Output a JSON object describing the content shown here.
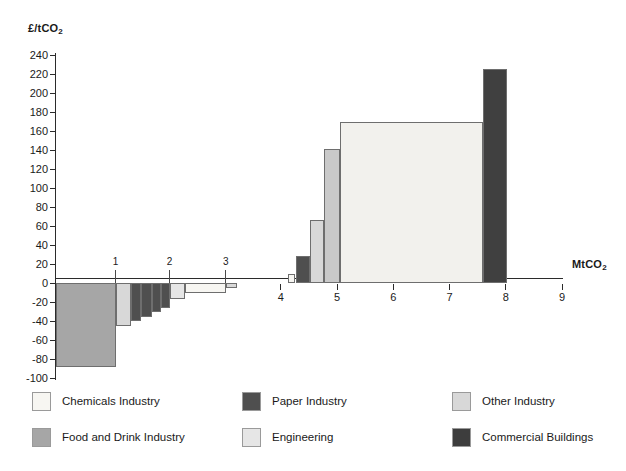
{
  "chart_data": {
    "type": "bar",
    "title": "",
    "subtitle": "",
    "ylabel": "£/tCO2",
    "ylabel_html": "£/tCO₂",
    "xlabel": "MtCO2",
    "xlabel_html": "MtCO₂",
    "ylim": [
      -100,
      240
    ],
    "xlim": [
      0,
      9
    ],
    "y_ticks": [
      240,
      220,
      200,
      180,
      160,
      140,
      120,
      100,
      80,
      60,
      40,
      20,
      0,
      -20,
      -40,
      -60,
      -80,
      -100
    ],
    "x_ticks": [
      0,
      1,
      2,
      3,
      4,
      5,
      6,
      7,
      8,
      9
    ],
    "x_ticks_visible": [
      4,
      5,
      6,
      7,
      8,
      9
    ],
    "grid": false,
    "legend_position": "bottom",
    "orientation": "marginal-abatement-cost-curve",
    "note": "Width of each bar = abatement potential in MtCO2; height = cost in GBP per tCO2",
    "series": [
      {
        "name": "Chemicals Industry",
        "color": "#f7f6f2"
      },
      {
        "name": "Paper Industry",
        "color": "#4f4f4f"
      },
      {
        "name": "Other Industry",
        "color": "#d8d8d8"
      },
      {
        "name": "Food and Drink Industry",
        "color": "#a6a6a6"
      },
      {
        "name": "Engineering",
        "color": "#e6e6e6"
      },
      {
        "name": "Commercial Buildings",
        "color": "#404040"
      }
    ],
    "bars": [
      {
        "category": "Food and Drink Industry",
        "x_start": 0.0,
        "x_end": 1.06,
        "value": -88,
        "color": "#a6a6a6"
      },
      {
        "category": "Other Industry",
        "x_start": 1.06,
        "x_end": 1.33,
        "value": -45,
        "color": "#d8d8d8"
      },
      {
        "category": "Paper Industry",
        "x_start": 1.33,
        "x_end": 1.52,
        "value": -40,
        "color": "#4f4f4f"
      },
      {
        "category": "Paper Industry",
        "x_start": 1.52,
        "x_end": 1.7,
        "value": -36,
        "color": "#4f4f4f"
      },
      {
        "category": "Paper Industry",
        "x_start": 1.7,
        "x_end": 1.86,
        "value": -31,
        "color": "#4f4f4f"
      },
      {
        "category": "Paper Industry",
        "x_start": 1.86,
        "x_end": 2.02,
        "value": -26,
        "color": "#4f4f4f"
      },
      {
        "category": "Engineering",
        "x_start": 2.02,
        "x_end": 2.3,
        "value": -17,
        "color": "#e6e6e6"
      },
      {
        "category": "Chemicals Industry",
        "x_start": 2.3,
        "x_end": 3.02,
        "value": -11,
        "color": "#f7f6f2"
      },
      {
        "category": "Other Industry",
        "x_start": 3.02,
        "x_end": 3.22,
        "value": -5,
        "color": "#d8d8d8"
      },
      {
        "category": "Chemicals Industry",
        "x_start": 4.12,
        "x_end": 4.26,
        "value": 10,
        "color": "#f7f6f2"
      },
      {
        "category": "Paper Industry",
        "x_start": 4.26,
        "x_end": 4.52,
        "value": 28,
        "color": "#4f4f4f"
      },
      {
        "category": "Other Industry",
        "x_start": 4.52,
        "x_end": 4.76,
        "value": 66,
        "color": "#d8d8d8"
      },
      {
        "category": "Engineering",
        "x_start": 4.76,
        "x_end": 5.05,
        "value": 141,
        "color": "#c9c9c9"
      },
      {
        "category": "Chemicals Industry",
        "x_start": 5.05,
        "x_end": 7.6,
        "value": 170,
        "color": "#f2f1ed"
      },
      {
        "category": "Commercial Buildings",
        "x_start": 7.6,
        "x_end": 8.02,
        "value": 225,
        "color": "#404040"
      }
    ],
    "annotations": [
      {
        "text": "1",
        "x": 1.06
      },
      {
        "text": "2",
        "x": 2.02
      },
      {
        "text": "3",
        "x": 3.02
      }
    ]
  },
  "legend": {
    "items": [
      {
        "label": "Chemicals Industry",
        "color": "#f7f6f2"
      },
      {
        "label": "Paper Industry",
        "color": "#4f4f4f"
      },
      {
        "label": "Other Industry",
        "color": "#d8d8d8"
      },
      {
        "label": "Food and Drink Industry",
        "color": "#a6a6a6"
      },
      {
        "label": "Engineering",
        "color": "#e6e6e6"
      },
      {
        "label": "Commercial Buildings",
        "color": "#3d3d3d"
      }
    ]
  }
}
